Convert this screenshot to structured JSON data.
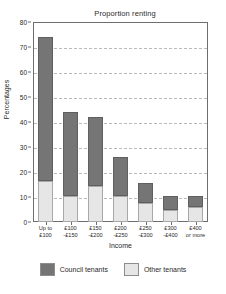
{
  "chart_data": {
    "type": "bar",
    "title": "Proportion renting",
    "xlabel": "Income",
    "ylabel": "Percentages",
    "ylim": [
      0,
      80
    ],
    "yticks": [
      0,
      10,
      20,
      30,
      40,
      50,
      60,
      70,
      80
    ],
    "grid": "horizontal-dashed",
    "stacked": true,
    "legend_position": "bottom",
    "categories": [
      "Up to\n£100",
      "£100\n-£150",
      "£150\n-£200",
      "£200\n-£250",
      "£250\n-£300",
      "£300\n-£400",
      "£400\nor more"
    ],
    "category_lines": [
      [
        "Up to",
        "£100"
      ],
      [
        "£100",
        "-£150"
      ],
      [
        "£150",
        "-£200"
      ],
      [
        "£200",
        "-£250"
      ],
      [
        "£250",
        "-£300"
      ],
      [
        "£300",
        "-£400"
      ],
      [
        "£400",
        "or more"
      ]
    ],
    "series": [
      {
        "name": "Other tenants",
        "color": "#e6e6e6",
        "values": [
          16.5,
          10.5,
          14.5,
          10.5,
          7.5,
          5.0,
          6.0
        ]
      },
      {
        "name": "Council tenants",
        "color": "#757575",
        "values": [
          57.5,
          33.5,
          27.5,
          15.5,
          8.0,
          5.5,
          4.5
        ]
      }
    ],
    "totals": [
      74.0,
      44.0,
      42.0,
      26.0,
      15.5,
      10.5,
      10.5
    ]
  },
  "legend": {
    "entries": [
      {
        "label": "Council tenants",
        "color": "#757575"
      },
      {
        "label": "Other tenants",
        "color": "#e6e6e6"
      }
    ]
  }
}
